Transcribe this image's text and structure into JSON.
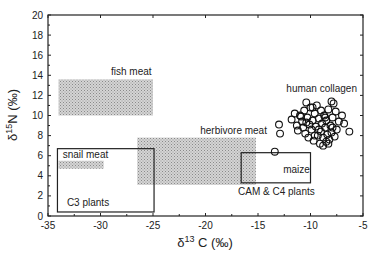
{
  "chart_data": {
    "type": "scatter",
    "title": "",
    "xlabel": "δ13C (‰)",
    "ylabel": "δ15N (‰)",
    "xlim": [
      -35,
      -5
    ],
    "ylim": [
      0,
      20
    ],
    "xticks": [
      -35,
      -30,
      -25,
      -20,
      -15,
      -10,
      -5
    ],
    "yticks": [
      0,
      2,
      4,
      6,
      8,
      10,
      12,
      14,
      16,
      18,
      20
    ],
    "grid": false,
    "legend": "none",
    "regions": [
      {
        "name": "fish meat",
        "style": "shaded",
        "x": [
          -34,
          -25
        ],
        "y": [
          10,
          13.6
        ],
        "label_pos": [
          -29,
          14.0
        ]
      },
      {
        "name": "herbivore meat",
        "style": "shaded",
        "x": [
          -26.5,
          -15.2
        ],
        "y": [
          3.1,
          7.8
        ],
        "label_pos": [
          -20.5,
          8.2
        ]
      },
      {
        "name": "snail meat",
        "style": "shaded",
        "x": [
          -34,
          -29.7
        ],
        "y": [
          4.7,
          5.5
        ],
        "label_pos": [
          -33.6,
          5.8
        ]
      },
      {
        "name": "C3 plants",
        "style": "outline",
        "x": [
          -34.1,
          -24.9
        ],
        "y": [
          0.4,
          6.7
        ],
        "label_pos": [
          -33.2,
          1.0
        ]
      },
      {
        "name": "CAM & C4 plants",
        "style": "outline",
        "x": [
          -16.6,
          -10
        ],
        "y": [
          3.3,
          6.3
        ],
        "label_pos": [
          -16.9,
          2.1
        ]
      },
      {
        "name": "maize",
        "style": "text",
        "label_pos": [
          -12.6,
          4.3
        ]
      }
    ],
    "series": [
      {
        "name": "human collagen",
        "marker": "open-circle",
        "label_pos": [
          -12.3,
          12.3
        ],
        "points": [
          [
            -13.0,
            9.1
          ],
          [
            -12.9,
            8.2
          ],
          [
            -13.4,
            6.4
          ],
          [
            -11.8,
            9.6
          ],
          [
            -11.5,
            10.2
          ],
          [
            -11.3,
            9.0
          ],
          [
            -11.2,
            8.5
          ],
          [
            -11.0,
            10.0
          ],
          [
            -10.8,
            9.4
          ],
          [
            -10.7,
            8.8
          ],
          [
            -10.6,
            10.5
          ],
          [
            -10.5,
            8.2
          ],
          [
            -10.4,
            11.3
          ],
          [
            -10.3,
            9.8
          ],
          [
            -10.2,
            7.8
          ],
          [
            -10.1,
            9.1
          ],
          [
            -10.0,
            10.8
          ],
          [
            -9.9,
            8.6
          ],
          [
            -9.8,
            9.5
          ],
          [
            -9.7,
            7.5
          ],
          [
            -9.6,
            10.2
          ],
          [
            -9.5,
            8.9
          ],
          [
            -9.4,
            11.0
          ],
          [
            -9.3,
            8.0
          ],
          [
            -9.2,
            9.7
          ],
          [
            -9.1,
            7.2
          ],
          [
            -9.0,
            10.5
          ],
          [
            -9.0,
            8.4
          ],
          [
            -8.9,
            9.2
          ],
          [
            -8.8,
            7.8
          ],
          [
            -8.7,
            10.0
          ],
          [
            -8.6,
            8.8
          ],
          [
            -8.5,
            7.4
          ],
          [
            -8.5,
            9.5
          ],
          [
            -8.4,
            8.1
          ],
          [
            -8.3,
            10.6
          ],
          [
            -8.2,
            7.6
          ],
          [
            -8.1,
            9.0
          ],
          [
            -8.0,
            11.4
          ],
          [
            -8.0,
            8.3
          ],
          [
            -7.9,
            9.8
          ],
          [
            -7.8,
            11.2
          ],
          [
            -7.7,
            7.9
          ],
          [
            -7.6,
            10.4
          ],
          [
            -7.5,
            8.6
          ],
          [
            -7.3,
            9.4
          ],
          [
            -7.0,
            10.0
          ],
          [
            -6.8,
            9.2
          ],
          [
            -6.3,
            8.4
          ],
          [
            -9.6,
            8.0
          ],
          [
            -9.2,
            8.6
          ],
          [
            -8.8,
            7.0
          ],
          [
            -8.6,
            9.8
          ],
          [
            -9.8,
            10.8
          ],
          [
            -10.9,
            9.9
          ],
          [
            -10.4,
            9.3
          ],
          [
            -8.3,
            7.2
          ],
          [
            -7.9,
            8.8
          ]
        ]
      }
    ]
  }
}
